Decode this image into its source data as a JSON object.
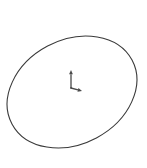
{
  "canvas": {
    "width": 147,
    "height": 168,
    "background_color": "#ffffff",
    "title": "Ellipse outline with coordinate axis marker"
  },
  "drawing": {
    "stroke_color": "#3a3a3a",
    "stroke_width": 1,
    "shapes": [
      {
        "name": "ellipse-outline",
        "type": "ellipse",
        "center_x": 72,
        "center_y": 92,
        "radius_x": 68,
        "radius_y": 52,
        "rotation_deg": -28,
        "fill": "none",
        "extremes": {
          "leftmost_x": 12,
          "rightmost_x": 133,
          "topmost_y": 28,
          "bottommost_y": 156
        }
      }
    ]
  },
  "axis_marker": {
    "name": "coordinate-axis-marker",
    "origin_x": 71,
    "origin_y": 88,
    "stroke_color": "#4a4a4a",
    "axes": [
      {
        "name": "vertical-axis",
        "direction": "up",
        "tip_x": 71,
        "tip_y": 70,
        "has_arrowhead": true
      },
      {
        "name": "diagonal-axis",
        "direction": "down-right",
        "tip_x": 82,
        "tip_y": 91,
        "has_arrowhead": true
      }
    ]
  },
  "chart_data": {
    "type": "line",
    "title": "",
    "xlabel": "",
    "ylabel": "",
    "grid": false,
    "legend": "none",
    "series": [
      {
        "name": "ellipse-outline",
        "values": []
      }
    ]
  }
}
